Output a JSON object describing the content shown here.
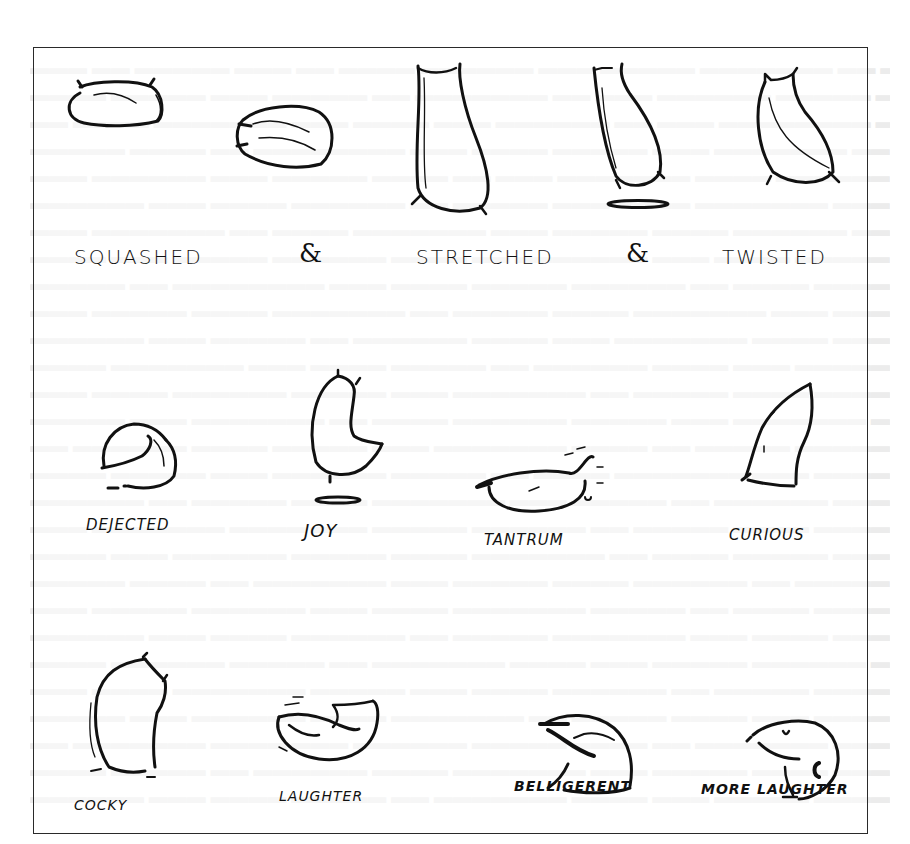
{
  "page": {
    "background_color": "#ffffff",
    "ink_color": "#111111",
    "border_color": "#2a2a2a"
  },
  "figure": {
    "rows": [
      {
        "name": "squash-stretch-twist",
        "labels": [
          "SQUASHED",
          "&",
          "STRETCHED",
          "&",
          "TWISTED"
        ]
      },
      {
        "name": "emotions",
        "labels": [
          "DEJECTED",
          "JOY",
          "TANTRUM",
          "CURIOUS"
        ]
      },
      {
        "name": "attitudes",
        "labels": [
          "COCKY",
          "LAUGHTER",
          "BELLIGERENT",
          "MORE LAUGHTER"
        ]
      }
    ],
    "sketches": [
      {
        "pose": "squashed-sack-1",
        "icon": "flour-sack-squashed-icon"
      },
      {
        "pose": "squashed-sack-2",
        "icon": "flour-sack-squashed-icon"
      },
      {
        "pose": "stretched-sack",
        "icon": "flour-sack-stretched-icon"
      },
      {
        "pose": "stretched-jumping-sack",
        "icon": "flour-sack-stretched-icon"
      },
      {
        "pose": "twisted-sack",
        "icon": "flour-sack-twisted-icon"
      },
      {
        "pose": "dejected-sack",
        "icon": "flour-sack-dejected-icon"
      },
      {
        "pose": "joy-sack",
        "icon": "flour-sack-joy-icon"
      },
      {
        "pose": "tantrum-sack",
        "icon": "flour-sack-tantrum-icon"
      },
      {
        "pose": "curious-sack",
        "icon": "flour-sack-curious-icon"
      },
      {
        "pose": "cocky-sack",
        "icon": "flour-sack-cocky-icon"
      },
      {
        "pose": "laughter-sack",
        "icon": "flour-sack-laughter-icon"
      },
      {
        "pose": "belligerent-sack",
        "icon": "flour-sack-belligerent-icon"
      },
      {
        "pose": "more-laughter-sack",
        "icon": "flour-sack-more-laughter-icon"
      }
    ]
  }
}
